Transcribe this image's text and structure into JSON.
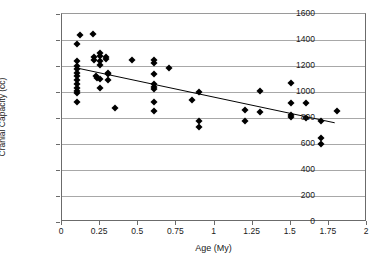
{
  "chart_data": {
    "type": "scatter",
    "title": "",
    "xlabel": "Age (My)",
    "ylabel": "Cranial Capacity (cc)",
    "xlim": [
      0,
      2
    ],
    "ylim": [
      0,
      1600
    ],
    "xticks": [
      "0",
      "0.25",
      "0.5",
      "0.75",
      "1",
      "1.25",
      "1.5",
      "1.75",
      "2"
    ],
    "xtick_values": [
      0,
      0.25,
      0.5,
      0.75,
      1,
      1.25,
      1.5,
      1.75,
      2
    ],
    "yticks": [
      "0",
      "200",
      "400",
      "600",
      "800",
      "1000",
      "1200",
      "1400",
      "1600"
    ],
    "ytick_values": [
      0,
      200,
      400,
      600,
      800,
      1000,
      1200,
      1400,
      1600
    ],
    "grid": "horizontal",
    "legend": "none",
    "marker": "filled-diamond",
    "marker_color": "#000000",
    "series": [
      {
        "name": "Hominin specimens",
        "points": [
          [
            0.1,
            1370
          ],
          [
            0.1,
            1240
          ],
          [
            0.1,
            1200
          ],
          [
            0.1,
            1175
          ],
          [
            0.1,
            1150
          ],
          [
            0.1,
            1120
          ],
          [
            0.1,
            1090
          ],
          [
            0.1,
            1060
          ],
          [
            0.1,
            1030
          ],
          [
            0.1,
            1010
          ],
          [
            0.1,
            995
          ],
          [
            0.1,
            920
          ],
          [
            0.12,
            1435
          ],
          [
            0.2,
            1450
          ],
          [
            0.21,
            1270
          ],
          [
            0.21,
            1245
          ],
          [
            0.22,
            1120
          ],
          [
            0.23,
            1105
          ],
          [
            0.25,
            1300
          ],
          [
            0.25,
            1280
          ],
          [
            0.25,
            1240
          ],
          [
            0.25,
            1205
          ],
          [
            0.25,
            1100
          ],
          [
            0.25,
            1030
          ],
          [
            0.29,
            1270
          ],
          [
            0.29,
            1255
          ],
          [
            0.3,
            1145
          ],
          [
            0.3,
            1135
          ],
          [
            0.3,
            1095
          ],
          [
            0.35,
            880
          ],
          [
            0.46,
            1250
          ],
          [
            0.6,
            1245
          ],
          [
            0.6,
            1225
          ],
          [
            0.6,
            1140
          ],
          [
            0.6,
            1060
          ],
          [
            0.6,
            1040
          ],
          [
            0.6,
            1020
          ],
          [
            0.6,
            920
          ],
          [
            0.6,
            855
          ],
          [
            0.7,
            1185
          ],
          [
            0.85,
            940
          ],
          [
            0.9,
            1000
          ],
          [
            0.9,
            780
          ],
          [
            0.9,
            730
          ],
          [
            1.2,
            860
          ],
          [
            1.2,
            780
          ],
          [
            1.3,
            1005
          ],
          [
            1.3,
            845
          ],
          [
            1.5,
            1070
          ],
          [
            1.5,
            915
          ],
          [
            1.5,
            820
          ],
          [
            1.5,
            810
          ],
          [
            1.6,
            915
          ],
          [
            1.6,
            800
          ],
          [
            1.7,
            780
          ],
          [
            1.7,
            650
          ],
          [
            1.7,
            600
          ],
          [
            1.8,
            855
          ]
        ]
      }
    ],
    "trendline": {
      "type": "linear",
      "x_start": 0.1,
      "y_start": 1180,
      "x_end": 1.8,
      "y_end": 755,
      "color": "#000000"
    }
  }
}
